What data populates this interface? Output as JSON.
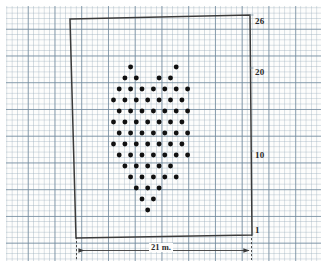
{
  "figure": {
    "type": "dot-plot-diagram",
    "caption_dimension": "21 m.",
    "background": "graph-paper",
    "colors": {
      "grid_minor": "#96aab9",
      "grid_major": "#6e8799",
      "outline": "#3a3a3a",
      "dot": "#101010",
      "text": "#2b2b2b"
    }
  },
  "axis_labels": {
    "top": "26",
    "upper": "20",
    "middle": "10",
    "bottom": "1"
  },
  "dimension": {
    "label": "21 m.",
    "value": 21,
    "unit": "m"
  },
  "plot_outline": {
    "shape": "quadrilateral",
    "corners": [
      {
        "x": 70,
        "y": 19
      },
      {
        "x": 250,
        "y": 15
      },
      {
        "x": 252,
        "y": 235
      },
      {
        "x": 76,
        "y": 238
      }
    ]
  },
  "chart_data": {
    "type": "scatter",
    "title": "",
    "xlabel": "21 m.",
    "ylabel": "",
    "grid": true,
    "legend": null,
    "point_count": 73,
    "lattice": {
      "kind": "staggered-triangular",
      "dx": 11.4,
      "dy": 11.0,
      "origin_x": 113.5,
      "origin_y": 67.0
    },
    "rows": [
      {
        "row": 0,
        "offset": 0.5,
        "cols": [
          1,
          5
        ]
      },
      {
        "row": 1,
        "offset": 0.0,
        "cols": [
          1,
          2,
          4,
          5
        ]
      },
      {
        "row": 2,
        "offset": 0.5,
        "cols": [
          0,
          1,
          2,
          3,
          4,
          5,
          6
        ]
      },
      {
        "row": 3,
        "offset": 0.0,
        "cols": [
          0,
          1,
          2,
          3,
          4,
          5,
          6
        ]
      },
      {
        "row": 4,
        "offset": 0.5,
        "cols": [
          0,
          1,
          2,
          3,
          4,
          5,
          6
        ]
      },
      {
        "row": 5,
        "offset": 0.0,
        "cols": [
          0,
          1,
          2,
          3,
          4,
          5,
          6
        ]
      },
      {
        "row": 6,
        "offset": 0.5,
        "cols": [
          0,
          1,
          2,
          3,
          4,
          5,
          6
        ]
      },
      {
        "row": 7,
        "offset": 0.0,
        "cols": [
          0,
          1,
          2,
          3,
          4,
          5,
          6
        ]
      },
      {
        "row": 8,
        "offset": 0.5,
        "cols": [
          0,
          1,
          2,
          3,
          4,
          5,
          6
        ]
      },
      {
        "row": 9,
        "offset": 0.0,
        "cols": [
          1,
          2,
          3,
          4,
          5
        ]
      },
      {
        "row": 10,
        "offset": 0.5,
        "cols": [
          1,
          2,
          3,
          4,
          5
        ]
      },
      {
        "row": 11,
        "offset": 0.0,
        "cols": [
          2,
          3,
          4
        ]
      },
      {
        "row": 12,
        "offset": 0.5,
        "cols": [
          2,
          3
        ]
      },
      {
        "row": 13,
        "offset": 0.0,
        "cols": [
          3
        ]
      }
    ]
  }
}
